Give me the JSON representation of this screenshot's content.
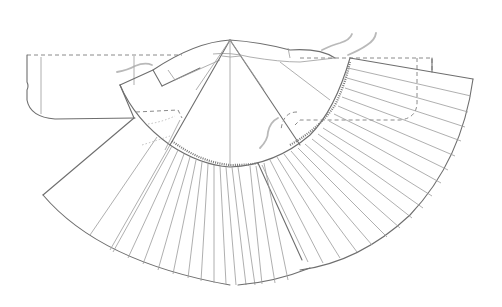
{
  "diagram": {
    "type": "garment pattern line drawing",
    "colors": {
      "background": "#ffffff",
      "line": "#6e6e6e",
      "light_line": "#9a9a9a",
      "dashed_line": "#8a8a8a",
      "squiggle": "#a8a8a8"
    },
    "geometry": {
      "apex": [
        230,
        40
      ],
      "yoke_inner_arc_center": [
        230,
        40
      ],
      "yoke_radius": 127,
      "hem_radius": 245,
      "pleat_count_left": 17,
      "pleat_count_right": 20
    }
  }
}
